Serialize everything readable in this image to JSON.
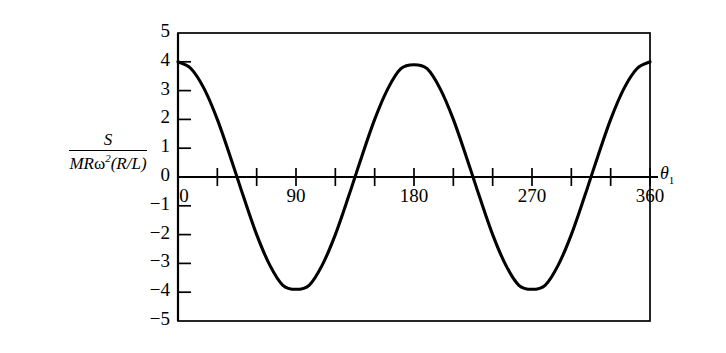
{
  "chart_data": {
    "type": "line",
    "title": "",
    "subtitle": "",
    "xlabel": "θ₁",
    "ylabel": "S / MRω²(R/L)",
    "ylabel_numerator": "S",
    "ylabel_denominator_prefix": "MR",
    "ylabel_denominator_omega": "ω",
    "ylabel_denominator_exponent": "2",
    "ylabel_denominator_suffix": "(R/L)",
    "xlim": [
      0,
      360
    ],
    "ylim": [
      -5,
      5
    ],
    "grid": false,
    "legend": "none",
    "x_tick_interval": 30,
    "y_tick_interval": 1,
    "x_tick_labels": [
      "0",
      "90",
      "180",
      "270",
      "360"
    ],
    "x_tick_label_values": [
      0,
      90,
      180,
      270,
      360
    ],
    "y_tick_labels": [
      "5",
      "4",
      "3",
      "2",
      "1",
      "0",
      "-1",
      "-2",
      "-3",
      "-4",
      "-5"
    ],
    "y_tick_label_values": [
      5,
      4,
      3,
      2,
      1,
      0,
      -1,
      -2,
      -3,
      -4,
      -5
    ],
    "series": [
      {
        "name": "S/(MRω²(R/L))",
        "expression": "4 cos(2θ₁)",
        "color": "#000000",
        "x": [
          0,
          10,
          20,
          30,
          40,
          45,
          50,
          60,
          70,
          80,
          90,
          100,
          110,
          120,
          130,
          135,
          140,
          150,
          160,
          170,
          180,
          190,
          200,
          210,
          220,
          225,
          230,
          240,
          250,
          260,
          270,
          280,
          290,
          300,
          310,
          315,
          320,
          330,
          340,
          350,
          360
        ],
        "y": [
          4.0,
          3.76,
          3.06,
          2.0,
          0.69,
          0.0,
          -0.69,
          -2.0,
          -3.06,
          -3.76,
          -3.9,
          -3.76,
          -3.06,
          -2.0,
          -0.69,
          0.0,
          0.69,
          2.0,
          3.06,
          3.76,
          3.9,
          3.76,
          3.06,
          2.0,
          0.69,
          0.0,
          -0.69,
          -2.0,
          -3.06,
          -3.76,
          -3.9,
          -3.76,
          -3.06,
          -2.0,
          -0.69,
          0.0,
          0.69,
          2.0,
          3.06,
          3.76,
          4.0
        ]
      }
    ],
    "annotations": {
      "maxima": [
        {
          "x": 0,
          "y": 4.0
        },
        {
          "x": 180,
          "y": 3.9
        },
        {
          "x": 360,
          "y": 4.0
        }
      ],
      "minima": [
        {
          "x": 90,
          "y": -3.9
        },
        {
          "x": 270,
          "y": -3.9
        }
      ],
      "zero_crossings": [
        45,
        135,
        225,
        315
      ]
    },
    "style": {
      "curve_color": "#000000",
      "axis_color": "#000000",
      "frame_color": "#000000",
      "background": "#ffffff",
      "curve_width": 3.0,
      "axis_width": 1.6
    }
  }
}
